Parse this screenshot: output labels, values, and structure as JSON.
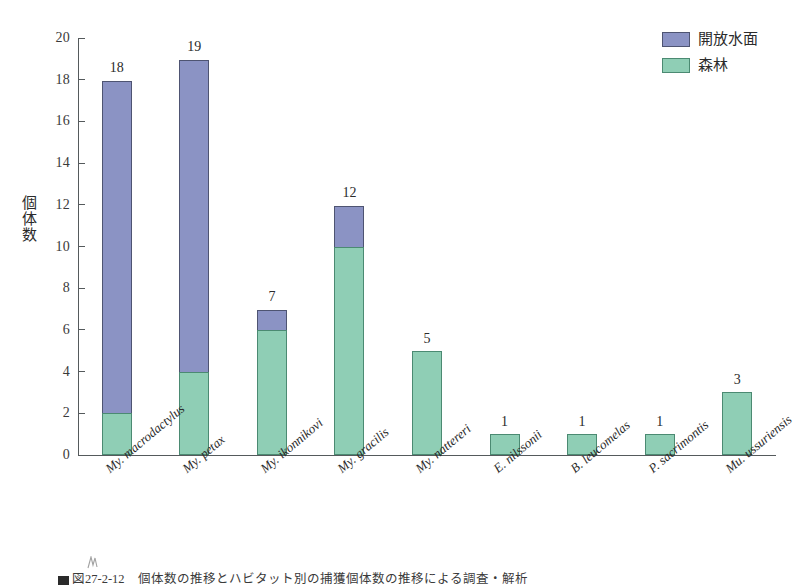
{
  "chart_data": {
    "type": "bar",
    "stacked": true,
    "title": "",
    "xlabel": "",
    "ylabel": "個体数",
    "ylim": [
      0,
      20
    ],
    "ytick_step": 2,
    "yticks": [
      20,
      18,
      16,
      14,
      12,
      10,
      8,
      6,
      4,
      2,
      0
    ],
    "grid": false,
    "legend_position": "top-right",
    "categories": [
      "My. macrodactylus",
      "My. petax",
      "My. ikonnikovi",
      "My. gracilis",
      "My. nattereri",
      "E. nilssonii",
      "B. leucomelas",
      "P. sacrimontis",
      "Mu. ussuriensis"
    ],
    "series": [
      {
        "name": "森林",
        "color": "#8fceb5",
        "values": [
          2,
          4,
          6,
          10,
          5,
          1,
          1,
          1,
          3
        ]
      },
      {
        "name": "開放水面",
        "color": "#8b93c4",
        "values": [
          16,
          15,
          1,
          2,
          0,
          0,
          0,
          0,
          0
        ]
      }
    ],
    "totals": [
      18,
      19,
      7,
      12,
      5,
      1,
      1,
      1,
      3
    ],
    "total_labels": [
      "18",
      "19",
      "7",
      "12",
      "5",
      "1",
      "1",
      "1",
      "3"
    ]
  },
  "legend": {
    "items": [
      {
        "label": "開放水面",
        "color": "#8b93c4",
        "key": "water"
      },
      {
        "label": "森林",
        "color": "#8fceb5",
        "key": "forest"
      }
    ]
  },
  "axes": {
    "y_title": "個体数",
    "y_tick_labels": [
      "20",
      "18",
      "16",
      "14",
      "12",
      "10",
      "8",
      "6",
      "4",
      "2",
      "0"
    ]
  },
  "caption": {
    "text": "図27-2-12　個体数の推移とハビタット別の捕獲個体数の推移による調査・解析"
  },
  "colors": {
    "water": "#8b93c4",
    "water_edge": "#4e5472",
    "forest": "#8fceb5",
    "forest_edge": "#4b8a72",
    "axis": "#555a5c",
    "text": "#2b2b2b",
    "background": "#ffffff"
  }
}
